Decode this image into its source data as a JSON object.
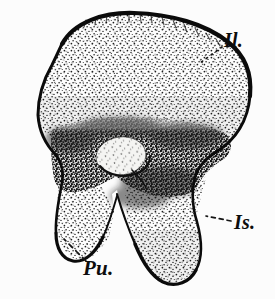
{
  "figure": {
    "kind": "anatomical-line-engraving",
    "background_color": "#fcfcfc",
    "ink_color": "#111111",
    "width": 275,
    "height": 299
  },
  "labels": [
    {
      "id": "il",
      "text": "Il.",
      "meaning": "ilium",
      "position": "upper-right",
      "leader": "dotted",
      "leader_from": [
        224,
        48
      ],
      "leader_to": [
        198,
        62
      ]
    },
    {
      "id": "is",
      "text": "Is.",
      "meaning": "ischium",
      "position": "right",
      "leader": "dashed",
      "leader_from": [
        232,
        222
      ],
      "leader_to": [
        205,
        218
      ]
    },
    {
      "id": "pu",
      "text": "Pu.",
      "meaning": "pubis",
      "position": "bottom-left",
      "leader": "dashed",
      "leader_from": [
        84,
        262
      ],
      "leader_to": [
        63,
        240
      ]
    }
  ],
  "regions": [
    {
      "id": "ilium",
      "name": "ilium-blade",
      "shading": "light-stipple",
      "description": "broad fan-shaped upper blade spanning the top of the figure"
    },
    {
      "id": "acetabular-mass",
      "name": "acetabular-region",
      "shading": "dark-dense-stipple",
      "description": "dark band across the middle containing the acetabulum"
    },
    {
      "id": "acetabulum",
      "name": "acetabulum-cavity",
      "shading": "light-oval",
      "description": "pale oval socket at centre of the dark band",
      "center": [
        121,
        156
      ],
      "radii": [
        24,
        18
      ]
    },
    {
      "id": "pubis",
      "name": "pubis-ramus",
      "shading": "light-stipple",
      "description": "left descending process with rounded tip"
    },
    {
      "id": "ischium",
      "name": "ischium-ramus",
      "shading": "light-stipple",
      "description": "right descending process, broader and longer"
    },
    {
      "id": "obturator-notch",
      "name": "obturator-notch",
      "shading": "blank",
      "description": "unshaded V-shaped gap between pubis and ischium"
    }
  ]
}
